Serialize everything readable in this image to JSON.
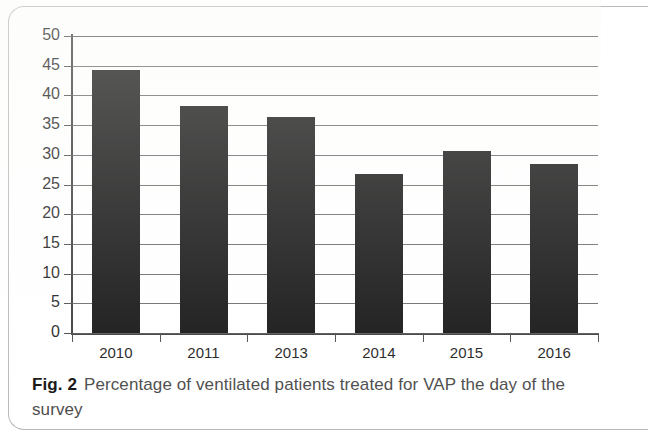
{
  "figure": {
    "caption_label": "Fig. 2",
    "caption_text": "Percentage of ventilated patients treated for VAP the day of the survey"
  },
  "chart_data": {
    "type": "bar",
    "title": "",
    "xlabel": "",
    "ylabel": "",
    "categories": [
      "2010",
      "2011",
      "2013",
      "2014",
      "2015",
      "2016"
    ],
    "values": [
      44.3,
      38.3,
      36.4,
      26.8,
      30.7,
      28.5
    ],
    "series": [
      {
        "name": "Percentage of ventilated patients treated for VAP",
        "values": [
          44.3,
          38.3,
          36.4,
          26.8,
          30.7,
          28.5
        ]
      }
    ],
    "ylim": [
      0,
      50
    ],
    "ytick_values": [
      0,
      5,
      10,
      15,
      20,
      25,
      30,
      35,
      40,
      45,
      50
    ],
    "ytick_labels": [
      "0",
      "5",
      "10",
      "15",
      "20",
      "25",
      "30",
      "35",
      "40",
      "45",
      "50"
    ],
    "grid": true,
    "grid_axis": "y",
    "legend": false,
    "bar_color": "#111111",
    "axis_color": "#3a3a3a",
    "gridline_color": "#555555"
  }
}
